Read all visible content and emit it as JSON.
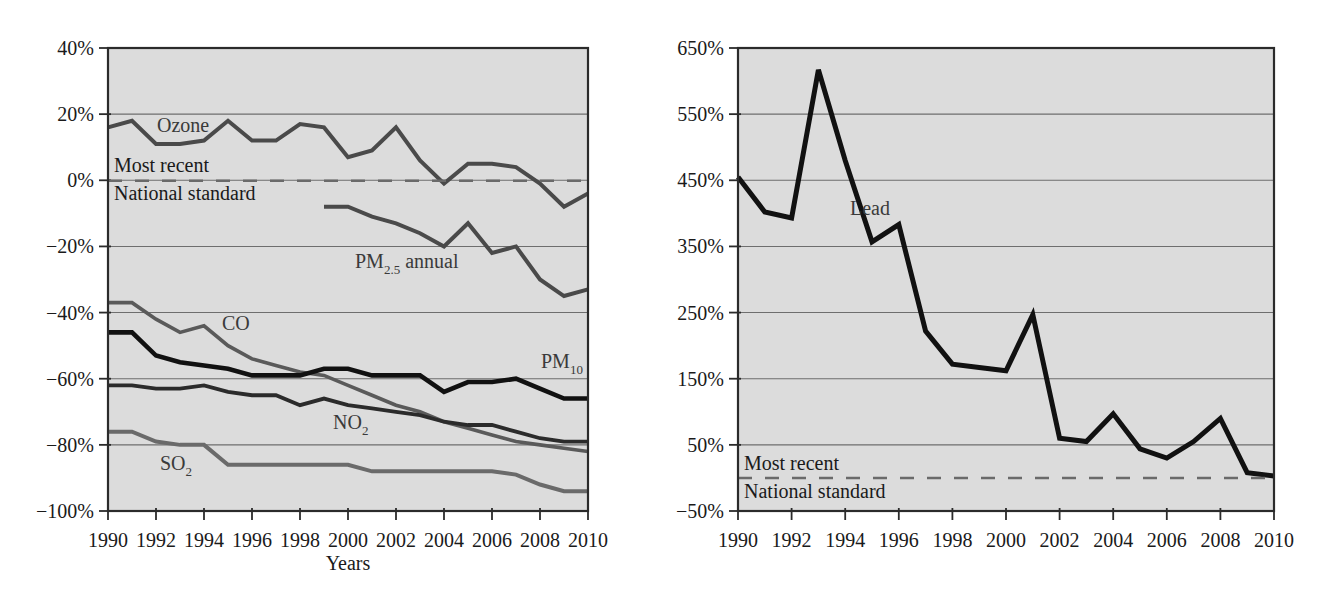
{
  "chart_data": [
    {
      "id": "criteria-pollutants",
      "type": "line",
      "title": "",
      "xlabel": "Years",
      "ylabel": "",
      "grid": true,
      "legend_position": "inline-labels",
      "xlim": [
        1990,
        2010
      ],
      "ylim": [
        -100,
        40
      ],
      "x_ticks": [
        1990,
        1992,
        1994,
        1996,
        1998,
        2000,
        2002,
        2004,
        2006,
        2008,
        2010
      ],
      "x_tick_labels": [
        "1990",
        "1992",
        "1994",
        "1996",
        "1998",
        "2000",
        "2002",
        "2004",
        "2006",
        "2008",
        "2010"
      ],
      "y_ticks": [
        40,
        20,
        0,
        -20,
        -40,
        -60,
        -80,
        -100
      ],
      "y_tick_labels": [
        "40%",
        "20%",
        "0%",
        "−20%",
        "−40%",
        "−60%",
        "−80%",
        "−100%"
      ],
      "reference_line": {
        "value": 0,
        "style": "dashed",
        "label_top": "Most recent",
        "label_bottom": "National standard"
      },
      "series": [
        {
          "name": "Ozone",
          "label": "Ozone",
          "color": "#4a4a4a",
          "width": 4.0,
          "x": [
            1990,
            1991,
            1992,
            1993,
            1994,
            1995,
            1996,
            1997,
            1998,
            1999,
            2000,
            2001,
            2002,
            2003,
            2004,
            2005,
            2006,
            2007,
            2008,
            2009,
            2010
          ],
          "values": [
            16,
            18,
            11,
            11,
            12,
            18,
            12,
            12,
            17,
            16,
            7,
            9,
            16,
            6,
            -1,
            5,
            5,
            4,
            -1,
            -8,
            -4
          ]
        },
        {
          "name": "PM2.5 annual",
          "label": "PM",
          "label_sub": "2.5",
          "label_tail": " annual",
          "color": "#4a4a4a",
          "width": 4.0,
          "x": [
            1999,
            2000,
            2001,
            2002,
            2003,
            2004,
            2005,
            2006,
            2007,
            2008,
            2009,
            2010
          ],
          "values": [
            -8,
            -8,
            -11,
            -13,
            -16,
            -20,
            -13,
            -22,
            -20,
            -30,
            -35,
            -33
          ]
        },
        {
          "name": "CO",
          "label": "CO",
          "color": "#5a5a5a",
          "width": 3.6,
          "x": [
            1990,
            1991,
            1992,
            1993,
            1994,
            1995,
            1996,
            1997,
            1998,
            1999,
            2000,
            2001,
            2002,
            2003,
            2004,
            2005,
            2006,
            2007,
            2008,
            2009,
            2010
          ],
          "values": [
            -37,
            -37,
            -42,
            -46,
            -44,
            -50,
            -54,
            -56,
            -58,
            -59,
            -62,
            -65,
            -68,
            -70,
            -73,
            -75,
            -77,
            -79,
            -80,
            -81,
            -82
          ]
        },
        {
          "name": "PM10",
          "label": "PM",
          "label_sub": "10",
          "color": "#111111",
          "width": 4.6,
          "x": [
            1990,
            1991,
            1992,
            1993,
            1994,
            1995,
            1996,
            1997,
            1998,
            1999,
            2000,
            2001,
            2002,
            2003,
            2004,
            2005,
            2006,
            2007,
            2008,
            2009,
            2010
          ],
          "values": [
            -46,
            -46,
            -53,
            -55,
            -56,
            -57,
            -59,
            -59,
            -59,
            -57,
            -57,
            -59,
            -59,
            -59,
            -64,
            -61,
            -61,
            -60,
            -63,
            -66,
            -66
          ]
        },
        {
          "name": "NO2",
          "label": "NO",
          "label_sub": "2",
          "color": "#2b2b2b",
          "width": 3.8,
          "x": [
            1990,
            1991,
            1992,
            1993,
            1994,
            1995,
            1996,
            1997,
            1998,
            1999,
            2000,
            2001,
            2002,
            2003,
            2004,
            2005,
            2006,
            2007,
            2008,
            2009,
            2010
          ],
          "values": [
            -62,
            -62,
            -63,
            -63,
            -62,
            -64,
            -65,
            -65,
            -68,
            -66,
            -68,
            -69,
            -70,
            -71,
            -73,
            -74,
            -74,
            -76,
            -78,
            -79,
            -79
          ]
        },
        {
          "name": "SO2",
          "label": "SO",
          "label_sub": "2",
          "color": "#6a6a6a",
          "width": 4.0,
          "x": [
            1990,
            1991,
            1992,
            1993,
            1994,
            1995,
            1996,
            1997,
            1998,
            1999,
            2000,
            2001,
            2002,
            2003,
            2004,
            2005,
            2006,
            2007,
            2008,
            2009,
            2010
          ],
          "values": [
            -76,
            -76,
            -79,
            -80,
            -80,
            -86,
            -86,
            -86,
            -86,
            -86,
            -86,
            -88,
            -88,
            -88,
            -88,
            -88,
            -88,
            -89,
            -92,
            -94,
            -94
          ]
        }
      ]
    },
    {
      "id": "lead",
      "type": "line",
      "title": "",
      "xlabel": "",
      "ylabel": "",
      "grid": true,
      "legend_position": "inline-labels",
      "xlim": [
        1990,
        2010
      ],
      "ylim": [
        -50,
        650
      ],
      "x_ticks": [
        1990,
        1992,
        1994,
        1996,
        1998,
        2000,
        2002,
        2004,
        2006,
        2008,
        2010
      ],
      "x_tick_labels": [
        "1990",
        "1992",
        "1994",
        "1996",
        "1998",
        "2000",
        "2002",
        "2004",
        "2006",
        "2008",
        "2010"
      ],
      "y_ticks": [
        650,
        550,
        450,
        350,
        250,
        150,
        50,
        -50
      ],
      "y_tick_labels": [
        "650%",
        "550%",
        "450%",
        "350%",
        "250%",
        "150%",
        "50%",
        "−50%"
      ],
      "reference_line": {
        "value": 0,
        "style": "dashed",
        "label_top": "Most recent",
        "label_bottom": "National standard"
      },
      "series": [
        {
          "name": "Lead",
          "label": "Lead",
          "color": "#111111",
          "width": 5.0,
          "x": [
            1990,
            1991,
            1992,
            1993,
            1994,
            1995,
            1996,
            1997,
            1998,
            1999,
            2000,
            2001,
            2002,
            2003,
            2004,
            2005,
            2006,
            2007,
            2008,
            2009,
            2010
          ],
          "values": [
            455,
            402,
            393,
            617,
            480,
            357,
            383,
            222,
            172,
            167,
            162,
            247,
            60,
            55,
            97,
            44,
            30,
            55,
            90,
            8,
            3
          ]
        }
      ]
    }
  ],
  "annotations": {
    "left": {
      "ozone": "Ozone",
      "pm25_main": "PM",
      "pm25_sub": "2.5",
      "pm25_tail": " annual",
      "co": "CO",
      "pm10_main": "PM",
      "pm10_sub": "10",
      "no2_main": "NO",
      "no2_sub": "2",
      "so2_main": "SO",
      "so2_sub": "2",
      "most_recent": "Most recent",
      "national_standard": "National standard",
      "xlabel": "Years"
    },
    "right": {
      "lead": "Lead",
      "most_recent": "Most recent",
      "national_standard": "National standard"
    }
  }
}
